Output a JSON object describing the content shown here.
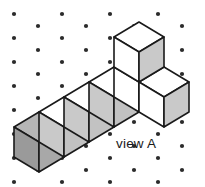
{
  "figure": {
    "caption": "view A",
    "background_color": "#ffffff",
    "line_color": "#1a1a1a",
    "dot_color": "#2b2b2b",
    "dot_radius": 2.1,
    "grid": {
      "description": "isometric dot lattice",
      "dots": [
        [
          14,
          14
        ],
        [
          62,
          14
        ],
        [
          110,
          14
        ],
        [
          158,
          14
        ],
        [
          38,
          26
        ],
        [
          86,
          26
        ],
        [
          134,
          26
        ],
        [
          182,
          26
        ],
        [
          14,
          38
        ],
        [
          62,
          38
        ],
        [
          110,
          38
        ],
        [
          158,
          38
        ],
        [
          38,
          50
        ],
        [
          86,
          50
        ],
        [
          134,
          50
        ],
        [
          182,
          50
        ],
        [
          14,
          62
        ],
        [
          62,
          62
        ],
        [
          110,
          62
        ],
        [
          158,
          62
        ],
        [
          38,
          74
        ],
        [
          86,
          74
        ],
        [
          134,
          74
        ],
        [
          182,
          74
        ],
        [
          14,
          86
        ],
        [
          62,
          86
        ],
        [
          110,
          86
        ],
        [
          158,
          86
        ],
        [
          38,
          98
        ],
        [
          86,
          98
        ],
        [
          134,
          98
        ],
        [
          182,
          98
        ],
        [
          14,
          110
        ],
        [
          62,
          110
        ],
        [
          110,
          110
        ],
        [
          158,
          110
        ],
        [
          38,
          122
        ],
        [
          86,
          122
        ],
        [
          134,
          122
        ],
        [
          182,
          122
        ],
        [
          14,
          134
        ],
        [
          62,
          134
        ],
        [
          110,
          134
        ],
        [
          158,
          134
        ],
        [
          38,
          146
        ],
        [
          86,
          146
        ],
        [
          134,
          146
        ],
        [
          182,
          146
        ],
        [
          14,
          158
        ],
        [
          62,
          158
        ],
        [
          110,
          158
        ],
        [
          158,
          158
        ],
        [
          38,
          170
        ],
        [
          86,
          170
        ],
        [
          134,
          170
        ],
        [
          182,
          170
        ],
        [
          14,
          182
        ],
        [
          62,
          182
        ],
        [
          110,
          182
        ],
        [
          158,
          182
        ]
      ]
    },
    "cubes": [
      {
        "name": "cube-row-1-leftmost",
        "top": {
          "points": "14,127 39,112 64,127 39,142",
          "fill": "#b5b5b5"
        },
        "left": {
          "points": "14,127 39,142 39,172 14,157",
          "fill": "#9a9a9a"
        },
        "right": {
          "points": "39,142 64,127 64,157 39,172",
          "fill": "#a8a8a8"
        }
      },
      {
        "name": "cube-row-1-second",
        "top": {
          "points": "39,112 64,97 89,112 64,127",
          "fill": "#ffffff"
        },
        "left": {
          "points": "39,112 64,127 64,157 39,142",
          "fill": "#c9c9c9"
        },
        "right": {
          "points": "64,127 89,112 89,142 64,157",
          "fill": "#c2c2c2"
        }
      },
      {
        "name": "cube-row-1-third",
        "top": {
          "points": "64,97 89,82 114,97 89,112",
          "fill": "#ffffff"
        },
        "left": {
          "points": "64,97 89,112 89,142 64,127",
          "fill": "#c9c9c9"
        },
        "right": {
          "points": "89,112 114,97 114,127 89,142",
          "fill": "#c2c2c2"
        }
      },
      {
        "name": "cube-row-1-fourth",
        "top": {
          "points": "89,82 114,67 139,82 114,97",
          "fill": "#ffffff"
        },
        "left": {
          "points": "89,82 114,97 114,127 89,112",
          "fill": "#c9c9c9"
        },
        "right": {
          "points": "114,97 139,82 139,112 114,127",
          "fill": "#c2c2c2"
        }
      },
      {
        "name": "cube-row-1-corner",
        "top": {
          "points": "114,67 139,52 164,67 139,82",
          "fill": "#ffffff"
        },
        "left": {
          "points": "114,67 139,82 139,112 114,97",
          "fill": "#ffffff"
        },
        "right": {
          "points": "139,82 164,67 164,97 139,112",
          "fill": "#c9c9c9"
        }
      },
      {
        "name": "cube-right-arm",
        "top": {
          "points": "139,82 164,67 189,82 164,97",
          "fill": "#ffffff"
        },
        "left": {
          "points": "139,82 164,97 164,127 139,112",
          "fill": "#ffffff"
        },
        "right": {
          "points": "164,97 189,82 189,112 164,127",
          "fill": "#c9c9c9"
        }
      },
      {
        "name": "cube-top-stacked",
        "top": {
          "points": "114,37 139,22 164,37 139,52",
          "fill": "#ffffff"
        },
        "left": {
          "points": "114,37 139,52 139,82 114,67",
          "fill": "#ffffff"
        },
        "right": {
          "points": "139,52 164,37 164,67 139,82",
          "fill": "#c9c9c9"
        }
      }
    ],
    "caption_position": {
      "x": 116,
      "y": 148
    }
  }
}
